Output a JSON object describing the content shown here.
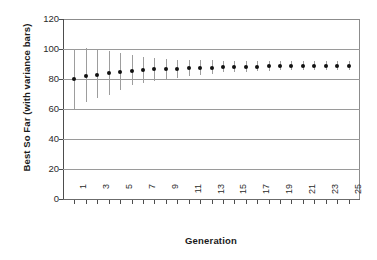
{
  "chart_data": {
    "type": "scatter",
    "title": "",
    "xlabel": "Generation",
    "ylabel": "Best So Far (with variance bars)",
    "xlim": [
      0,
      26
    ],
    "ylim": [
      0,
      120
    ],
    "yticks": [
      0,
      20,
      40,
      60,
      80,
      100,
      120
    ],
    "xticks": [
      1,
      2,
      3,
      4,
      5,
      6,
      7,
      8,
      9,
      10,
      11,
      12,
      13,
      14,
      15,
      16,
      17,
      18,
      19,
      20,
      21,
      22,
      23,
      24,
      25
    ],
    "xtick_labels_shown": [
      "1",
      "3",
      "5",
      "7",
      "9",
      "11",
      "13",
      "15",
      "17",
      "19",
      "21",
      "23",
      "25"
    ],
    "grid": "horizontal",
    "legend": "none",
    "marker_color": "#111111",
    "errorbar_color": "#9d9d9d",
    "x": [
      1,
      2,
      3,
      4,
      5,
      6,
      7,
      8,
      9,
      10,
      11,
      12,
      13,
      14,
      15,
      16,
      17,
      18,
      19,
      20,
      21,
      22,
      23,
      24,
      25
    ],
    "values": [
      80.0,
      82.0,
      83.0,
      84.0,
      85.0,
      85.5,
      86.0,
      86.5,
      86.8,
      87.0,
      87.2,
      87.5,
      87.6,
      88.0,
      88.1,
      88.2,
      88.3,
      88.4,
      88.5,
      88.8,
      88.9,
      89.0,
      89.0,
      89.0,
      89.0
    ],
    "err_upper": [
      100.0,
      100.5,
      99.5,
      98.5,
      97.5,
      96.0,
      95.0,
      94.0,
      93.5,
      93.0,
      93.0,
      92.5,
      92.5,
      92.0,
      92.0,
      92.0,
      92.0,
      92.0,
      92.0,
      92.0,
      92.0,
      92.0,
      92.0,
      92.0,
      92.0
    ],
    "err_lower": [
      60.0,
      64.5,
      67.5,
      69.5,
      73.0,
      76.0,
      77.5,
      79.0,
      80.0,
      81.0,
      82.0,
      83.0,
      83.5,
      84.5,
      85.0,
      85.0,
      85.5,
      85.5,
      86.0,
      86.0,
      86.0,
      86.0,
      86.0,
      86.0,
      86.0
    ]
  },
  "axis": {
    "ylabel_text": "Best So Far (with variance bars)",
    "xlabel_text": "Generation"
  }
}
